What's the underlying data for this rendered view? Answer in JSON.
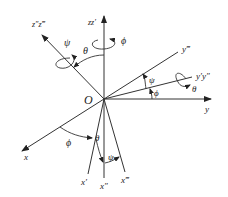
{
  "figure": {
    "origin_label": "O",
    "axes": {
      "z_fixed": "zz′",
      "z_rotated": "z″z‴",
      "y_fixed": "y",
      "y_first": "y′y″",
      "y_final": "y‴",
      "x_fixed": "x",
      "x_first": "x′",
      "x_second": "x″",
      "x_final": "x‴"
    },
    "angles": {
      "psi_top": "ψ",
      "theta_top": "θ",
      "phi_top": "ϕ",
      "psi_right": "ψ",
      "phi_right": "ϕ",
      "theta_right": "θ",
      "phi_bottom": "ϕ",
      "theta_bottom": "θ",
      "psi_bottom": "ψ"
    },
    "colors": {
      "line": "#333333",
      "text": "#222222",
      "background": "#ffffff"
    }
  }
}
